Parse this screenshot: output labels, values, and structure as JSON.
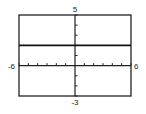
{
  "chart_data": {
    "type": "line",
    "title": "",
    "xlabel": "",
    "ylabel": "",
    "xlim": [
      -6,
      6
    ],
    "ylim": [
      -3,
      5
    ],
    "x_tick_step": 1,
    "y_tick_step": 1,
    "grid": false,
    "tick_labels": {
      "xmin": "-6",
      "xmax": "6",
      "ymax": "5",
      "ymin": "-3"
    },
    "series": [
      {
        "name": "y = 2",
        "x": [
          -6,
          6
        ],
        "y": [
          2,
          2
        ]
      }
    ]
  }
}
